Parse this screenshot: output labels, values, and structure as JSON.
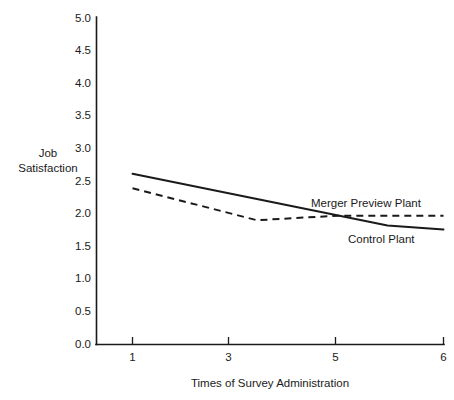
{
  "chart_data": {
    "type": "line",
    "title": "",
    "xlabel": "Times of Survey Administration",
    "ylabel": "Job Satisfaction",
    "ylabel_line1": "Job",
    "ylabel_line2": "Satisfaction",
    "xlim": [
      0,
      6
    ],
    "ylim": [
      0.0,
      5.0
    ],
    "grid": false,
    "legend_position": "inline-right",
    "x_ticks": [
      1,
      3,
      5,
      6
    ],
    "x_tick_labels": [
      "1",
      "3",
      "5",
      "6"
    ],
    "y_ticks": [
      0.0,
      0.5,
      1.0,
      1.5,
      2.0,
      2.5,
      3.0,
      3.5,
      4.0,
      4.5,
      5.0
    ],
    "y_tick_labels": [
      "0.0",
      "0.5",
      "1.0",
      "1.5",
      "2.0",
      "2.5",
      "3.0",
      "3.5",
      "4.0",
      "4.5",
      "5.0"
    ],
    "series": [
      {
        "name": "Merger Preview Plant",
        "style": "dashed",
        "label_text": "Merger Preview Plant",
        "x": [
          1,
          3,
          4.3,
          6
        ],
        "values": [
          2.39,
          1.9,
          1.97,
          1.97
        ]
      },
      {
        "name": "Control Plant",
        "style": "solid",
        "label_text": "Control Plant",
        "x": [
          1,
          5.1,
          6
        ],
        "values": [
          2.61,
          1.82,
          1.76
        ]
      }
    ],
    "annotations": [
      {
        "text": "Merger Preview Plant",
        "x": 4.55,
        "y": 2.18
      },
      {
        "text": "Control Plant",
        "x": 5.0,
        "y": 1.57
      }
    ]
  },
  "colors": {
    "ink": "#1a1a1a",
    "background": "#ffffff"
  }
}
